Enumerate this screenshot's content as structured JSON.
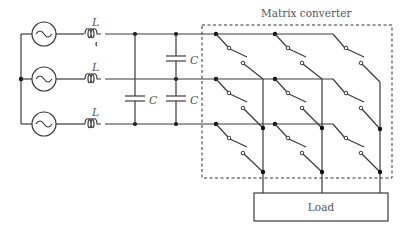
{
  "diagram": {
    "title": "Matrix converter",
    "load_label": "Load",
    "inductor_label": "L",
    "capacitor_label": "C",
    "phases": 3,
    "components": {
      "sources": [
        "ac-source-1",
        "ac-source-2",
        "ac-source-3"
      ],
      "inductors": [
        "L",
        "L",
        "L"
      ],
      "capacitors": [
        "C",
        "C",
        "C"
      ],
      "switch_matrix": "3x3 bidirectional switches"
    },
    "colors": {
      "wire": "#3a3a3a",
      "text": "#555555",
      "background": "#ffffff"
    }
  }
}
